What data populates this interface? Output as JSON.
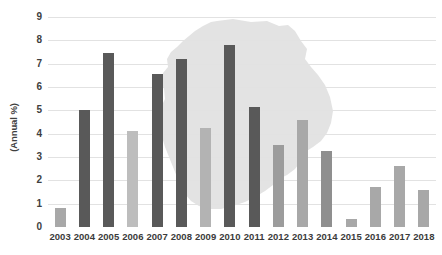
{
  "chart_data": {
    "type": "bar",
    "title": "",
    "subtitle": "",
    "xlabel": "",
    "ylabel": "(Annual %)",
    "categories": [
      "2003",
      "2004",
      "2005",
      "2006",
      "2007",
      "2008",
      "2009",
      "2010",
      "2011",
      "2012",
      "2013",
      "2014",
      "2015",
      "2016",
      "2017",
      "2018"
    ],
    "values": [
      0.8,
      5.0,
      7.45,
      4.1,
      6.55,
      7.2,
      4.25,
      7.8,
      5.15,
      3.5,
      4.6,
      3.25,
      0.35,
      1.7,
      2.6,
      1.6
    ],
    "bar_colors": [
      "#a8a8a8",
      "#595959",
      "#595959",
      "#bdbdbd",
      "#595959",
      "#595959",
      "#b3b3b3",
      "#595959",
      "#595959",
      "#9c9c9c",
      "#a8a8a8",
      "#8f8f8f",
      "#a8a8a8",
      "#a8a8a8",
      "#a8a8a8",
      "#a8a8a8"
    ],
    "ylim": [
      0,
      9
    ],
    "yticks": [
      "0",
      "1",
      "2",
      "3",
      "4",
      "5",
      "6",
      "7",
      "8",
      "9"
    ],
    "grid": true,
    "legend": "none",
    "background_watermark": "uruguay-map-silhouette",
    "watermark_color": "#e3e3e3"
  },
  "colors": {
    "dark_bar": "#595959",
    "light_bar": "#a8a8a8",
    "gridline": "#e2e2e2",
    "axis_text": "#404040",
    "watermark": "#e3e3e3",
    "background": "#ffffff"
  }
}
